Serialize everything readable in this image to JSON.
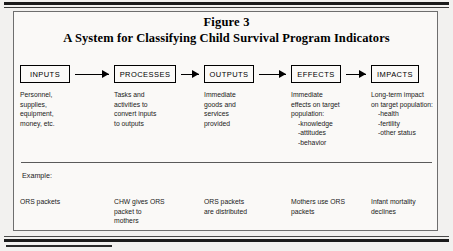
{
  "figure": {
    "title_line1": "Figure 3",
    "title_line2": "A System for Classifying Child Survival Program Indicators",
    "example_label": "Example:"
  },
  "flow": {
    "nodes": [
      {
        "label": "INPUTS"
      },
      {
        "label": "PROCESSES"
      },
      {
        "label": "OUTPUTS"
      },
      {
        "label": "EFFECTS"
      },
      {
        "label": "IMPACTS"
      }
    ]
  },
  "descriptions": [
    {
      "lines": [
        "Personnel,",
        "supplies,",
        "equipment,",
        "money, etc."
      ],
      "sublines": []
    },
    {
      "lines": [
        "Tasks and",
        "activities to",
        "convert inputs",
        "to outputs"
      ],
      "sublines": []
    },
    {
      "lines": [
        "Immediate",
        "goods and",
        "services",
        "provided"
      ],
      "sublines": []
    },
    {
      "lines": [
        "Immediate",
        "effects on target",
        "population:"
      ],
      "sublines": [
        "-knowledge",
        "-attitudes",
        "-behavior"
      ]
    },
    {
      "lines": [
        "Long-term impact",
        "on target population:"
      ],
      "sublines": [
        "-health",
        "-fertility",
        "-other status"
      ]
    }
  ],
  "examples": [
    {
      "lines": [
        "ORS packets"
      ]
    },
    {
      "lines": [
        "CHW gives ORS",
        "packet to",
        "mothers"
      ]
    },
    {
      "lines": [
        "ORS packets",
        "are distributed"
      ]
    },
    {
      "lines": [
        "Mothers use ORS",
        "packets"
      ]
    },
    {
      "lines": [
        "Infant mortality",
        "declines"
      ]
    }
  ],
  "colors": {
    "frame": "#6e6e6e",
    "rule": "#1b1b1b",
    "text": "#1a1a1a",
    "page_background": "#f2f1ef",
    "figure_background": "#faf9f7"
  }
}
